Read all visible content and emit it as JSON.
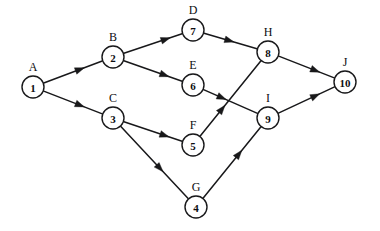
{
  "diagram": {
    "type": "directed-graph",
    "background_color": "#ffffff",
    "line_color": "#18181a",
    "node_fill_color": "#ffffff",
    "width": 380,
    "height": 231,
    "node_radius": 11,
    "nodes": [
      {
        "id": "1",
        "number": "1",
        "letter": "A",
        "cx": 33,
        "cy": 87,
        "label_dx": 0,
        "label_dy": -20
      },
      {
        "id": "2",
        "number": "2",
        "letter": "B",
        "cx": 113,
        "cy": 57,
        "label_dx": 0,
        "label_dy": -20
      },
      {
        "id": "3",
        "number": "3",
        "letter": "C",
        "cx": 113,
        "cy": 118,
        "label_dx": 0,
        "label_dy": -20
      },
      {
        "id": "4",
        "number": "4",
        "letter": "G",
        "cx": 196,
        "cy": 207,
        "label_dx": 0,
        "label_dy": -20
      },
      {
        "id": "5",
        "number": "5",
        "letter": "F",
        "cx": 193,
        "cy": 145,
        "label_dx": 0,
        "label_dy": -20
      },
      {
        "id": "6",
        "number": "6",
        "letter": "E",
        "cx": 193,
        "cy": 85,
        "label_dx": 0,
        "label_dy": -20
      },
      {
        "id": "7",
        "number": "7",
        "letter": "D",
        "cx": 193,
        "cy": 30,
        "label_dx": 0,
        "label_dy": -20
      },
      {
        "id": "8",
        "number": "8",
        "letter": "H",
        "cx": 268,
        "cy": 52,
        "label_dx": 0,
        "label_dy": -20
      },
      {
        "id": "9",
        "number": "9",
        "letter": "I",
        "cx": 268,
        "cy": 118,
        "label_dx": 0,
        "label_dy": -20
      },
      {
        "id": "10",
        "number": "10",
        "letter": "J",
        "cx": 345,
        "cy": 82,
        "label_dx": 0,
        "label_dy": -20
      }
    ],
    "edges": [
      {
        "from": "1",
        "to": "2",
        "arrow_at": 0.62
      },
      {
        "from": "1",
        "to": "3",
        "arrow_at": 0.62
      },
      {
        "from": "2",
        "to": "7",
        "arrow_at": 0.72
      },
      {
        "from": "2",
        "to": "6",
        "arrow_at": 0.7
      },
      {
        "from": "3",
        "to": "5",
        "arrow_at": 0.7
      },
      {
        "from": "3",
        "to": "4",
        "arrow_at": 0.58
      },
      {
        "from": "7",
        "to": "8",
        "arrow_at": 0.48
      },
      {
        "from": "6",
        "to": "9",
        "arrow_at": 0.34
      },
      {
        "from": "5",
        "to": "8",
        "arrow_at": 0.36
      },
      {
        "from": "4",
        "to": "9",
        "arrow_at": 0.62
      },
      {
        "from": "8",
        "to": "10",
        "arrow_at": 0.66
      },
      {
        "from": "9",
        "to": "10",
        "arrow_at": 0.66
      }
    ]
  }
}
